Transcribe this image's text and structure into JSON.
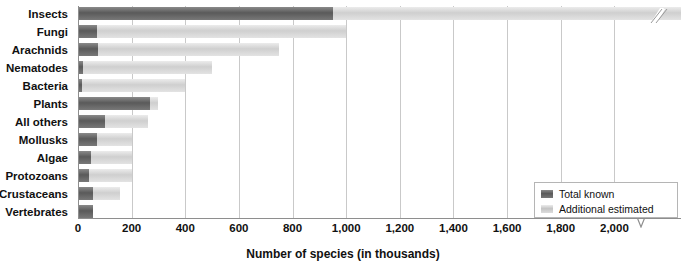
{
  "chart_data": {
    "type": "bar",
    "orientation": "horizontal",
    "title": "",
    "xlabel": "Number of species (in thousands)",
    "ylabel": "",
    "xlim": [
      0,
      2100
    ],
    "grid": true,
    "axis_break": {
      "after": 2000,
      "final_tick": 8000
    },
    "legend_position": "bottom-right",
    "tick_labels": [
      "0",
      "200",
      "400",
      "600",
      "800",
      "1,000",
      "1,200",
      "1,400",
      "1,600",
      "1,800",
      "2,000",
      "8,000"
    ],
    "tick_values": [
      0,
      200,
      400,
      600,
      800,
      1000,
      1200,
      1400,
      1600,
      1800,
      2000,
      8000
    ],
    "categories": [
      "Insects",
      "Fungi",
      "Arachnids",
      "Nematodes",
      "Bacteria",
      "Plants",
      "All others",
      "Mollusks",
      "Algae",
      "Protozoans",
      "Crustaceans",
      "Vertebrates"
    ],
    "series": [
      {
        "name": "Total known",
        "color": "#5a5a5a",
        "values": [
          950,
          72,
          75,
          20,
          10,
          270,
          100,
          70,
          50,
          40,
          55,
          55
        ]
      },
      {
        "name": "Additional estimated",
        "color": "#c4c4c4",
        "values": [
          8000,
          1000,
          750,
          500,
          400,
          300,
          260,
          200,
          200,
          200,
          155,
          55
        ]
      }
    ]
  },
  "legend": {
    "items": [
      {
        "label": "Total known",
        "color": "#5a5a5a"
      },
      {
        "label": "Additional estimated",
        "color": "#c4c4c4"
      }
    ]
  },
  "axis": {
    "title": "Number of species (in thousands)"
  }
}
